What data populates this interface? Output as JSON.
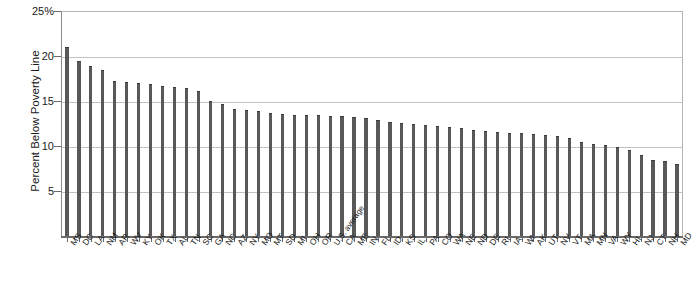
{
  "figure": {
    "top_sliver_text": "",
    "axis": {
      "y_title": "Percent Below Poverty Line",
      "y_ticks": [
        "25%",
        "20",
        "15",
        "10",
        "5"
      ],
      "y_tick_values": [
        25,
        20,
        15,
        10,
        5
      ],
      "y_min": 0,
      "y_max": 25
    },
    "colors": {
      "bar": "#585858",
      "bar_top": "#3d3d3d",
      "gridline": "#c2c2c2",
      "axis": "#6a6a6a",
      "text": "#1a1a1a",
      "background": "#ffffff"
    }
  },
  "chart_data": {
    "type": "bar",
    "title": "",
    "xlabel": "",
    "ylabel": "Percent Below Poverty Line",
    "ylim": [
      0,
      25
    ],
    "grid": true,
    "legend": "none",
    "categories": [
      "MS",
      "DC",
      "LA",
      "NM",
      "AR",
      "WV",
      "KY",
      "OK",
      "TX",
      "AL",
      "TN",
      "SC",
      "GA",
      "NC",
      "AZ",
      "NY",
      "MO",
      "MT",
      "SD",
      "MI",
      "OH",
      "OR",
      "U.S. average",
      "CA",
      "ME",
      "IN",
      "FL",
      "ID",
      "KS",
      "IL",
      "PA",
      "CO",
      "WA",
      "NE",
      "ND",
      "DE",
      "RI",
      "IA",
      "WI",
      "AK",
      "UT",
      "NV",
      "VT",
      "MA",
      "MN",
      "VA",
      "WY",
      "HI",
      "NJ",
      "CT",
      "NH",
      "MD"
    ],
    "values": [
      21.0,
      19.5,
      18.9,
      18.4,
      17.2,
      17.1,
      17.0,
      16.9,
      16.7,
      16.6,
      16.4,
      16.1,
      15.0,
      14.7,
      14.1,
      14.0,
      13.9,
      13.7,
      13.6,
      13.5,
      13.4,
      13.4,
      13.3,
      13.3,
      13.2,
      13.1,
      12.9,
      12.7,
      12.6,
      12.4,
      12.3,
      12.2,
      12.1,
      12.0,
      11.8,
      11.7,
      11.6,
      11.5,
      11.4,
      11.3,
      11.2,
      11.1,
      10.9,
      10.4,
      10.2,
      10.1,
      9.9,
      9.6,
      9.0,
      8.5,
      8.3,
      8.0
    ]
  }
}
